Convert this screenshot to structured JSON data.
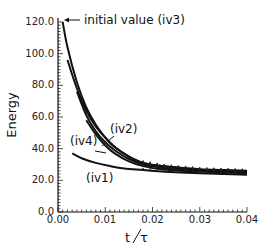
{
  "chart_data": {
    "type": "line",
    "title": "",
    "xlabel": "t/τ",
    "ylabel": "Energy",
    "xlim": [
      0.0,
      0.04
    ],
    "ylim": [
      0.0,
      120.0
    ],
    "grid": false,
    "legend": "none (inline annotations)",
    "x_ticks": [
      "0.00",
      "0.01",
      "0.02",
      "0.03",
      "0.04"
    ],
    "y_ticks": [
      "0.0",
      "20.0",
      "40.0",
      "60.0",
      "80.0",
      "100.0",
      "120.0"
    ],
    "annotations": [
      {
        "text": "initial value (iv3)",
        "arrow_to": [
          0.0012,
          119
        ]
      },
      {
        "text": "(iv2)",
        "at": [
          0.0125,
          52
        ]
      },
      {
        "text": "(iv4)",
        "at": [
          0.004,
          44
        ]
      },
      {
        "text": "(iv1)",
        "at": [
          0.011,
          24
        ]
      }
    ],
    "series": [
      {
        "name": "iv3",
        "x": [
          0.001,
          0.002,
          0.004,
          0.006,
          0.008,
          0.01,
          0.012,
          0.015,
          0.018,
          0.022,
          0.026,
          0.03,
          0.035,
          0.04
        ],
        "y": [
          120,
          104,
          82,
          66,
          55,
          47,
          41,
          35,
          31,
          29,
          28,
          27,
          26.5,
          26
        ]
      },
      {
        "name": "curve (start 96)",
        "x": [
          0.002,
          0.004,
          0.006,
          0.008,
          0.01,
          0.012,
          0.015,
          0.018,
          0.022,
          0.026,
          0.03,
          0.035,
          0.04
        ],
        "y": [
          96,
          78,
          64,
          54,
          47,
          41,
          35,
          31,
          29,
          27.5,
          26.5,
          26,
          25.5
        ]
      },
      {
        "name": "iv2",
        "x": [
          0.004,
          0.006,
          0.008,
          0.01,
          0.012,
          0.015,
          0.018,
          0.022,
          0.026,
          0.03,
          0.035,
          0.04
        ],
        "y": [
          76,
          61,
          51,
          44,
          39,
          33.5,
          30,
          28,
          27,
          26,
          25.5,
          25
        ]
      },
      {
        "name": "iv4",
        "x": [
          0.006,
          0.008,
          0.01,
          0.012,
          0.015,
          0.018,
          0.022,
          0.026,
          0.03,
          0.035,
          0.04
        ],
        "y": [
          58,
          49,
          42,
          37,
          32,
          29,
          27,
          26,
          25.5,
          25,
          24.5
        ]
      },
      {
        "name": "iv1",
        "x": [
          0.003,
          0.005,
          0.008,
          0.011,
          0.014,
          0.018,
          0.022,
          0.026,
          0.03,
          0.035,
          0.04
        ],
        "y": [
          37,
          34,
          31,
          29,
          27.5,
          26.5,
          25.5,
          25,
          24.5,
          24,
          23.5
        ]
      }
    ]
  },
  "labels": {
    "xlabel_t": "t",
    "xlabel_tau": "τ",
    "ylabel": "Energy",
    "annot_iv3": "initial value  (iv3)",
    "annot_iv2": "(iv2)",
    "annot_iv4": "(iv4)",
    "annot_iv1": "(iv1)"
  },
  "ticks": {
    "x": [
      "0.00",
      "0.01",
      "0.02",
      "0.03",
      "0.04"
    ],
    "y": [
      "0.0",
      "20.0",
      "40.0",
      "60.0",
      "80.0",
      "100.0",
      "120.0"
    ]
  }
}
